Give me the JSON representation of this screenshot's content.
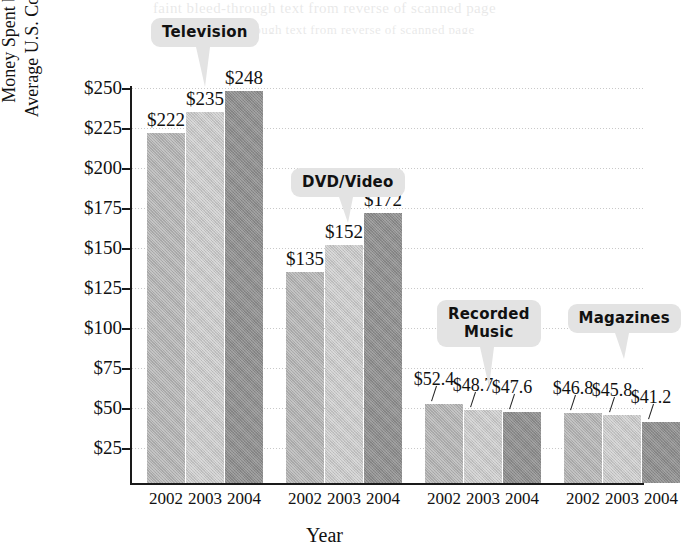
{
  "ghost": {
    "line1": "faint bleed-through text from reverse of scanned page",
    "line2": "faint bleed-through text from reverse of scanned page"
  },
  "chart_data": {
    "type": "bar",
    "title": "",
    "xlabel": "Year",
    "ylabel": "Money Spent by the Average U.S. Consumer",
    "ylabel_lines": [
      "Money Spent by the",
      "Average U.S. Consumer"
    ],
    "ylim": [
      0,
      250
    ],
    "ytick_values": [
      250,
      225,
      200,
      175,
      150,
      125,
      100,
      75,
      50,
      25
    ],
    "ytick_labels": [
      "$250",
      "$225",
      "$200",
      "$175",
      "$150",
      "$125",
      "$100",
      "$75",
      "$50",
      "$25"
    ],
    "grid": true,
    "grid_style": "dotted-horizontal",
    "legend": "none",
    "categories": [
      "2002",
      "2003",
      "2004"
    ],
    "groups": [
      {
        "name": "Television",
        "callout": "Television",
        "bars": [
          {
            "year": "2002",
            "value": 222,
            "label": "$222"
          },
          {
            "year": "2003",
            "value": 235,
            "label": "$235"
          },
          {
            "year": "2004",
            "value": 248,
            "label": "$248"
          }
        ]
      },
      {
        "name": "DVD/Video",
        "callout": "DVD/Video",
        "bars": [
          {
            "year": "2002",
            "value": 135,
            "label": "$135"
          },
          {
            "year": "2003",
            "value": 152,
            "label": "$152"
          },
          {
            "year": "2004",
            "value": 172,
            "label": "$172"
          }
        ]
      },
      {
        "name": "Recorded Music",
        "callout": "Recorded\nMusic",
        "bars": [
          {
            "year": "2002",
            "value": 52.4,
            "label": "$52.4"
          },
          {
            "year": "2003",
            "value": 48.7,
            "label": "$48.7"
          },
          {
            "year": "2004",
            "value": 47.6,
            "label": "$47.6"
          }
        ]
      },
      {
        "name": "Magazines",
        "callout": "Magazines",
        "bars": [
          {
            "year": "2002",
            "value": 46.8,
            "label": "$46.8"
          },
          {
            "year": "2003",
            "value": 45.8,
            "label": "$45.8"
          },
          {
            "year": "2004",
            "value": 41.2,
            "label": "$41.2"
          }
        ]
      }
    ],
    "series_colors": {
      "2002": "#adadad",
      "2003": "#c4c4c4",
      "2004": "#8c8c8c"
    },
    "callout_bg": "#e3e3e3",
    "axis_color": "#1a1a1a",
    "grid_color": "#c9c9c9"
  }
}
